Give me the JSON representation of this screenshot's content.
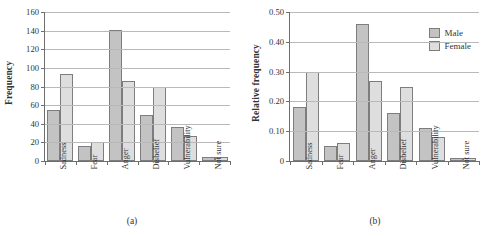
{
  "chart_data": [
    {
      "type": "bar",
      "panel": "a",
      "caption": "(a)",
      "title": "",
      "xlabel": "",
      "ylabel": "Frequency",
      "categories": [
        "Sadness",
        "Fear",
        "Anger",
        "Disbelief",
        "Vulnerability",
        "Not sure"
      ],
      "series": [
        {
          "name": "Male",
          "values": [
            55,
            16,
            141,
            49,
            36,
            4
          ],
          "color": "#c3c3c3"
        },
        {
          "name": "Female",
          "values": [
            93,
            20,
            86,
            79,
            27,
            4
          ],
          "color": "#dedede"
        }
      ],
      "ylim": [
        0,
        160
      ],
      "yticks": [
        0,
        20,
        40,
        60,
        80,
        100,
        120,
        140,
        160
      ],
      "ytick_labels": [
        "0",
        "20",
        "40",
        "60",
        "80",
        "100",
        "120",
        "140",
        "160"
      ],
      "grid": true,
      "legend": false
    },
    {
      "type": "bar",
      "panel": "b",
      "caption": "(b)",
      "title": "",
      "xlabel": "",
      "ylabel": "Relative frequency",
      "categories": [
        "Sadness",
        "Fear",
        "Anger",
        "Disbelief",
        "Vulnerability",
        "Not sure"
      ],
      "series": [
        {
          "name": "Male",
          "values": [
            0.18,
            0.05,
            0.46,
            0.16,
            0.11,
            0.01
          ],
          "color": "#c3c3c3"
        },
        {
          "name": "Female",
          "values": [
            0.3,
            0.06,
            0.27,
            0.25,
            0.08,
            0.01
          ],
          "color": "#dedede"
        }
      ],
      "ylim": [
        0,
        0.5
      ],
      "yticks": [
        0,
        0.1,
        0.2,
        0.3,
        0.4,
        0.5
      ],
      "ytick_labels": [
        "0",
        "0.10",
        "0.20",
        "0.30",
        "0.40",
        "0.50"
      ],
      "grid": true,
      "legend": true,
      "legend_position": "top-right",
      "legend_entries": [
        "Male",
        "Female"
      ]
    }
  ]
}
